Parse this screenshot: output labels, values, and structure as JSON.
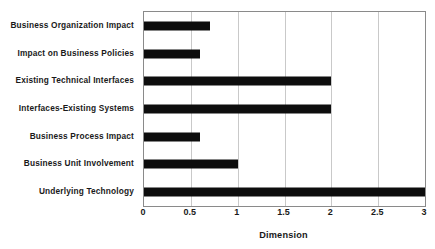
{
  "chart_data": {
    "type": "bar",
    "orientation": "horizontal",
    "title": "",
    "xlabel": "Dimension",
    "ylabel": "",
    "xlim": [
      0,
      3
    ],
    "ylim": null,
    "grid": true,
    "legend": null,
    "xticks": [
      "0",
      "0.5",
      "1",
      "1.5",
      "2",
      "2.5",
      "3"
    ],
    "xtick_values": [
      0,
      0.5,
      1,
      1.5,
      2,
      2.5,
      3
    ],
    "categories": [
      "Business Organization Impact",
      "Impact on Business Policies",
      "Existing Technical Interfaces",
      "Interfaces-Existing Systems",
      "Business Process Impact",
      "Business Unit Involvement",
      "Underlying Technology"
    ],
    "values": [
      0.7,
      0.6,
      2.0,
      2.0,
      0.6,
      1.0,
      3.0
    ],
    "bar_color": "#0d0d0d",
    "grid_color": "#c9c9c9",
    "axis_color": "#8a8a8a",
    "background_color": "#ffffff"
  }
}
